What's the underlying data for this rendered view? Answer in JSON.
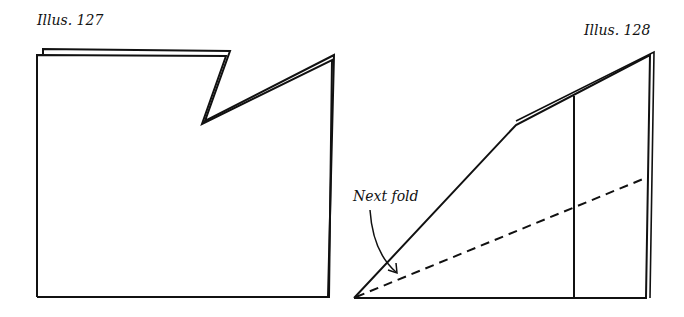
{
  "illustrations": [
    {
      "caption": "Illus. 127",
      "shape": "folded rectangle with notched top-right corner (double-line edges)"
    },
    {
      "caption": "Illus. 128",
      "shape": "folded trapezoid with vertical crease and dashed fold line",
      "annotation": "Next fold",
      "fold_line_style": "dashed"
    }
  ],
  "colors": {
    "line": "#111111",
    "background": "#ffffff"
  }
}
